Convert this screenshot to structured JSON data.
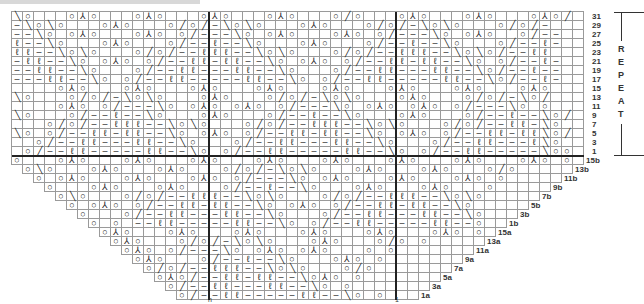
{
  "chart_title": "",
  "symbols": {
    "o": "yarn-over",
    "\\": "ssk",
    "/": "k2tog",
    "^": "sk2p",
    "-": "purl",
    "q": "knit-tbl",
    ".": "knit"
  },
  "glyphs": {
    "o": "○",
    "\\": "╲",
    "/": "╱",
    "^": "⅄",
    "-": "–",
    "q": "ℓ",
    ".": ""
  },
  "repeat_label": [
    "R",
    "E",
    "P",
    "E",
    "A",
    "T"
  ],
  "repeat_row_labels": [
    "31",
    "29",
    "27",
    "25",
    "23",
    "21",
    "19",
    "17",
    "15",
    "13",
    "11",
    "9",
    "7",
    "5",
    "3",
    "1"
  ],
  "triangle_row_labels": [
    "15b",
    "13b",
    "11b",
    "9b",
    "7b",
    "5b",
    "3b",
    "1b",
    "15a",
    "13a",
    "11a",
    "9a",
    "7a",
    "5a",
    "3a",
    "1a"
  ],
  "bottom_marks": [
    {
      "label": "n",
      "col": 18
    },
    {
      "label": "1",
      "col": 35
    }
  ],
  "columns": 52,
  "repeat_rows": [
    "\\o...o^o...o^o...o^o...o^o...o/o...o^o...o^o...o^o/",
    "-\\o\\o...o^o...o/o/-\\o\\o...o^o...o/o/-\\o\\o...o/o/-",
    "--\\o.o^o...o^o.o/---\\o.o^o...o^o.o/---\\o.o^o..o/--",
    "q--\\o...o^o...o/--q--\\o...o^o...o/--q--\\o...o/--q-",
    "qq--\\o\\o...o/o/--qqq--\\o\\o...o/o/--qqq--\\o\\o/--qq",
    "-qq--\\o.o^o.o/--qq-qq--\\o.o^o.o/--qq-qq--\\o.o/--q-",
    "--qq--\\o...o/--qq---qq--\\o...o/--qq---qq--\\o/--q--",
    "---qq--\\o.o/--qq-----qq--\\o.o/--qq-----qq--\\o/--q-",
    "....o^o...o^o...o^o...o^o...o^o...o^o...o^o...o^o..",
    "\\o...o/o/-\\o\\o...o^o...o/o/-\\o\\o...o^o...o/o/-\\o/",
    "....o^o.o/---\\o.o^o.o^o.o/---\\o.o^o.o^o.o/---\\o.o.",
    "\\o...o/--q--\\o...o^o...o/--q--\\o...o^o...o/--q--\\o/",
    "...o/o/--qqq--\\o\\o...o/o/--qqq--\\o\\o...o/o/--qq-\\o",
    "\\o.o/--qq-qq--\\o.o^o.o/--qq-qq--\\o.o^o.o/--qq-qq\\o/",
    "..o/--qq---qq--\\o...o/--qq---qq--\\o...o/--qq---q\\o.",
    ".o/--qq-----qq--\\o.o/--qq-----qq--\\o.o/--qq-----\\oo"
  ],
  "triangle_rows": [
    "o...o^o...o^o...o^o...o^o...o^o...o^o...o^o...o^o.o",
    "o\\o...o^o...o^o...o/o/-\\o\\o...o^o...o^o...o/o",
    "o.o^o...o^o...o^o.o/---\\o.o^o...o^o...o^o.o",
    "o...o^o...o^o...o/--q--\\o...o^o...o^o...o",
    "o\\o...o/o/--qqq--\\o\\o...o/o/--qqq--\\o\\o",
    "o.o^o.o/--qq-qq--\\o.o^o.o/--qq-qq--\\o",
    "o...o/--qq---qq--\\o...o/--qq---qq--\\o",
    "o.o.--qq-----qq--\\o.o/--qq-----qq--o",
    "o^o...o^o...o^o...o^o...o^o...o^o.o",
    "o^o...o/o/-\\o\\o...o^o...o/o.o",
    "o^o.o/---\\o.o^o.o^o...o.o",
    "o^o...o/--q--\\o...o^o.o",
    "o/o/--qqq--\\o\\o...o/o",
    "o^o/--qq-qq--\\o^o.o",
    "o/--qq---qq--\\o.o",
    "o/--qq-----qq--\\o.o"
  ]
}
